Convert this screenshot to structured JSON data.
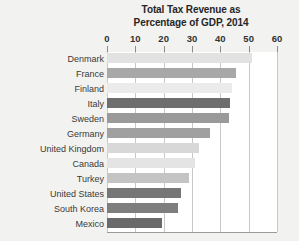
{
  "chart": {
    "title_line1": "Total Tax Revenue as",
    "title_line2": "Percentage of GDP, 2014"
  },
  "chart_data": {
    "type": "bar",
    "orientation": "horizontal",
    "title": "Total Tax Revenue as Percentage of GDP, 2014",
    "xlabel": "",
    "ylabel": "",
    "xlim": [
      0,
      60
    ],
    "xticks": [
      0,
      10,
      20,
      30,
      40,
      50,
      60
    ],
    "xticklabels": [
      "0",
      "10",
      "20",
      "30",
      "40",
      "50",
      "60"
    ],
    "grid": true,
    "legend": false,
    "categories": [
      "Denmark",
      "France",
      "Finland",
      "Italy",
      "Sweden",
      "Germany",
      "United Kingdom",
      "Canada",
      "Turkey",
      "United States",
      "South Korea",
      "Mexico"
    ],
    "values": [
      51,
      45.5,
      44,
      43.5,
      43,
      36.5,
      32.5,
      31,
      29,
      26,
      25,
      19.5
    ],
    "colors": [
      "#e2e2e2",
      "#a8a8a8",
      "#ebebeb",
      "#6e6e6e",
      "#9a9a9a",
      "#a0a0a0",
      "#d8d8d8",
      "#e4e4e4",
      "#c4c4c4",
      "#767676",
      "#7e7e7e",
      "#6a6a6a"
    ]
  }
}
